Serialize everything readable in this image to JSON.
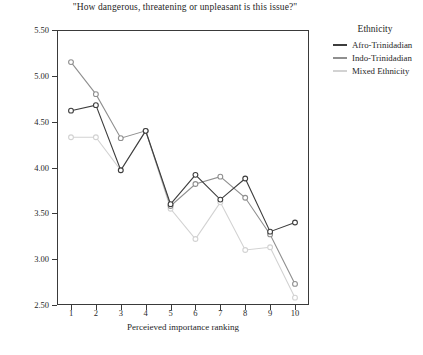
{
  "chart_data": {
    "type": "line",
    "title": "\"How dangerous, threatening or unpleasant is this issue?\"",
    "xlabel": "Perceieved importance ranking",
    "ylabel": "Estimated Marginal Means",
    "categories": [
      "1",
      "2",
      "3",
      "4",
      "5",
      "6",
      "7",
      "8",
      "9",
      "10"
    ],
    "x": [
      1,
      2,
      3,
      4,
      5,
      6,
      7,
      8,
      9,
      10
    ],
    "ylim": [
      2.5,
      5.5
    ],
    "yticks": [
      "2.50",
      "3.00",
      "3.50",
      "4.00",
      "4.50",
      "5.00",
      "5.50"
    ],
    "ytick_values": [
      2.5,
      3.0,
      3.5,
      4.0,
      4.5,
      5.0,
      5.5
    ],
    "grid": false,
    "legend_position": "right",
    "legend_title": "Ethnicity",
    "markers": "open-circle",
    "series": [
      {
        "name": "Afro-Trinidadian",
        "color": "#3d3d3d",
        "values": [
          4.62,
          4.68,
          3.97,
          4.4,
          3.6,
          3.92,
          3.65,
          3.88,
          3.3,
          3.4
        ]
      },
      {
        "name": "Indo-Trinidadian",
        "color": "#8f8f8f",
        "values": [
          5.15,
          4.8,
          4.32,
          4.4,
          3.58,
          3.82,
          3.9,
          3.67,
          3.27,
          2.73
        ]
      },
      {
        "name": "Mixed Ethnicity",
        "color": "#d2d2d2",
        "values": [
          4.33,
          4.33,
          3.97,
          4.4,
          3.55,
          3.22,
          3.62,
          3.1,
          3.13,
          2.58
        ]
      }
    ]
  }
}
